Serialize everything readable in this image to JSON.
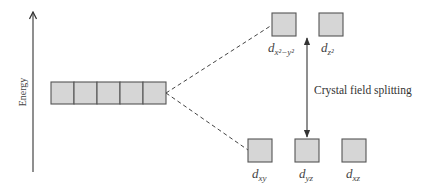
{
  "axis": {
    "label": "Energy",
    "direction": "up"
  },
  "degenerate_set": {
    "orbital_count": 5,
    "description": "five degenerate d orbitals"
  },
  "upper_set": {
    "orbitals": [
      {
        "base": "d",
        "sub": "x²−y²",
        "label": "d_x2-y2"
      },
      {
        "base": "d",
        "sub": "z²",
        "label": "d_z2"
      }
    ]
  },
  "lower_set": {
    "orbitals": [
      {
        "base": "d",
        "sub": "xy",
        "label": "d_xy"
      },
      {
        "base": "d",
        "sub": "yz",
        "label": "d_yz"
      },
      {
        "base": "d",
        "sub": "xz",
        "label": "d_xz"
      }
    ]
  },
  "splitting": {
    "label": "Crystal field splitting"
  },
  "colors": {
    "orbital_fill": "#d6d6d6",
    "orbital_stroke": "#555555",
    "line": "#333333"
  }
}
